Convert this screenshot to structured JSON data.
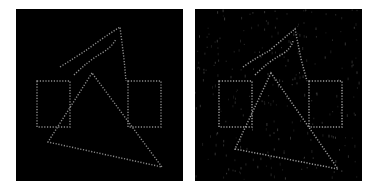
{
  "figure": {
    "panels": [
      {
        "id": "left",
        "description": "Clean dotted edge map",
        "noise": false,
        "colors": {
          "background": "#000000",
          "edge": "#8c8c8c"
        }
      },
      {
        "id": "right",
        "description": "Noisy dotted edge map",
        "noise": true,
        "colors": {
          "background": "#000000",
          "edge": "#9a9a9a",
          "noise": "#3a3a3a"
        }
      }
    ],
    "shapes": [
      "left-rectangle",
      "right-rectangle",
      "triangle",
      "hook-curve"
    ]
  }
}
